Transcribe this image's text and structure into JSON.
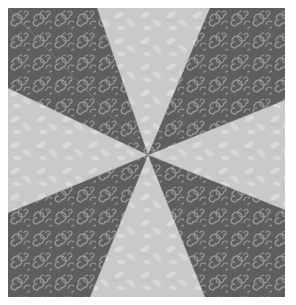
{
  "image": {
    "subject": "pinwheel quilt block",
    "description": "Square quilt block with eight triangular wedges radiating from the center, alternating dark gray fabric with light scroll swirls and light gray fabric with subtle leaf print",
    "blade_count": 8,
    "colors": {
      "background": "#ffffff",
      "dark_fabric": "#5e5e5e",
      "dark_fabric_pattern": "#9a9a9a",
      "light_fabric": "#c9c9c9",
      "light_fabric_pattern": "#dddddd"
    }
  }
}
